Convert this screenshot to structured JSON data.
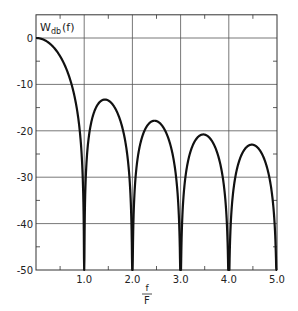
{
  "chart_data": {
    "type": "line",
    "title": "",
    "ylabel": "W_db(f)",
    "ylabel_main": "W",
    "ylabel_sub": "db",
    "ylabel_arg": "(f)",
    "xlabel": "f/F",
    "xlabel_num": "f",
    "xlabel_den": "F",
    "xlim": [
      0,
      5.0
    ],
    "ylim": [
      -50,
      5
    ],
    "grid": true,
    "legend": "none",
    "x_ticks": [
      1.0,
      2.0,
      3.0,
      4.0,
      5.0
    ],
    "x_tick_labels": [
      "1.0",
      "2.0",
      "3.0",
      "4.0",
      "5.0"
    ],
    "x_minor_ticks": [
      0.5,
      1.5,
      2.5,
      3.5,
      4.5
    ],
    "y_ticks": [
      0,
      -10,
      -20,
      -30,
      -40,
      -50
    ],
    "y_tick_labels": [
      "0",
      "-10",
      "-20",
      "-30",
      "-40",
      "-50"
    ],
    "y_minor_ticks": [
      -5,
      -15,
      -25,
      -35,
      -45
    ],
    "series": [
      {
        "name": "W_db(f) = 20 log10 |sin(pi f/F)/(pi f/F)|",
        "color": "#111111",
        "nulls_at": [
          1.0,
          2.0,
          3.0,
          4.0,
          5.0
        ],
        "sidelobe_peaks": [
          {
            "x": 0.0,
            "y": 0
          },
          {
            "x": 1.43,
            "y": -13.3
          },
          {
            "x": 2.46,
            "y": -17.8
          },
          {
            "x": 3.47,
            "y": -20.8
          },
          {
            "x": 4.48,
            "y": -23.0
          }
        ],
        "x": [
          0,
          0.25,
          0.5,
          0.75,
          0.9,
          1.0,
          1.1,
          1.25,
          1.43,
          1.6,
          1.75,
          1.9,
          2.0,
          2.1,
          2.25,
          2.46,
          2.75,
          2.9,
          3.0,
          3.1,
          3.25,
          3.47,
          3.75,
          3.9,
          4.0,
          4.1,
          4.25,
          4.48,
          4.75,
          4.9,
          5.0
        ],
        "values": [
          0,
          -0.9,
          -3.9,
          -10.5,
          -18.9,
          -50,
          -21.7,
          -16.9,
          -13.3,
          -14.5,
          -18.0,
          -26.9,
          -50,
          -27.3,
          -21.8,
          -17.8,
          -21.3,
          -30.6,
          -50,
          -30.7,
          -24.8,
          -20.8,
          -23.9,
          -32.9,
          -50,
          -33.0,
          -26.9,
          -23.0,
          -26.0,
          -34.6,
          -50
        ]
      }
    ]
  }
}
